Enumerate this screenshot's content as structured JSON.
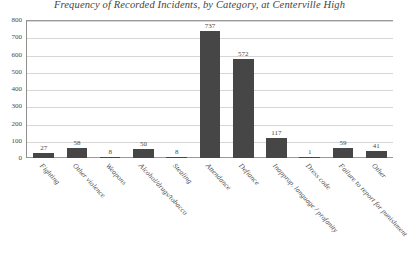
{
  "chart_data": {
    "type": "bar",
    "title": "Frequency of Recorded Incidents, by Category, at Centerville High",
    "xlabel": "",
    "ylabel": "",
    "ylim": [
      0,
      800
    ],
    "ytick_step": 100,
    "ytick_labels": [
      "800",
      "700",
      "600",
      "500",
      "400",
      "300",
      "200",
      "100",
      "0"
    ],
    "grid": true,
    "legend": false,
    "bar_color": "#464646",
    "gridline_color": "#d6d6d6",
    "axis_color": "#9a9a9a",
    "data_labels": true,
    "categories": [
      "Fighting",
      "Other violence",
      "Weapons",
      "Alcohol/drugs/tobacco",
      "Stealing",
      "Attendance",
      "Defiance",
      "Inapprop. language / profanity",
      "Dress code",
      "Failure to report for punishment",
      "Other"
    ],
    "values": [
      27,
      58,
      8,
      50,
      8,
      737,
      572,
      117,
      1,
      59,
      41
    ]
  }
}
